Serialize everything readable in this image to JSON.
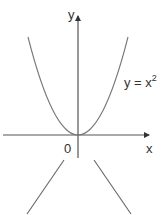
{
  "diagram": {
    "axes": {
      "x_label": "x",
      "y_label": "y",
      "origin_label": "0"
    },
    "curve": {
      "equation_prefix": "y = x",
      "equation_exponent": "2",
      "type": "parabola"
    },
    "colors": {
      "axis": "#555555",
      "curve": "#777777",
      "text": "#333333",
      "background": "#ffffff"
    }
  }
}
